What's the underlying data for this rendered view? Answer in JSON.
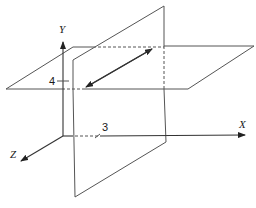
{
  "diagram": {
    "type": "3d-coordinate-planes",
    "axes": {
      "x_label": "X",
      "y_label": "Y",
      "z_label": "Z"
    },
    "ticks": {
      "y_tick": "4",
      "x_tick": "3"
    },
    "planes": [
      {
        "name": "horizontal-plane",
        "equation": "y = 4"
      },
      {
        "name": "vertical-plane",
        "equation": "x = 3"
      }
    ],
    "annotations": {
      "intersection_arrow": "double-headed arrow along intersection line"
    },
    "colors": {
      "line": "#555555",
      "axis": "#333333",
      "background": "#ffffff"
    }
  }
}
